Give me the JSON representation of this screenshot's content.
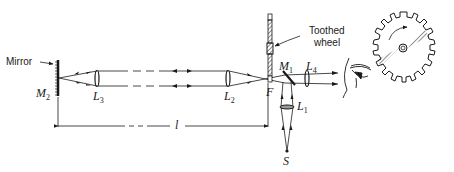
{
  "labels": {
    "mirror": "Mirror",
    "toothed_wheel_line1": "Toothed",
    "toothed_wheel_line2": "wheel",
    "M2": {
      "main": "M",
      "sub": "2"
    },
    "L3": {
      "main": "L",
      "sub": "3"
    },
    "L2": {
      "main": "L",
      "sub": "2"
    },
    "F": "F",
    "M1": {
      "main": "M",
      "sub": "1"
    },
    "L4": {
      "main": "L",
      "sub": "4"
    },
    "L1": {
      "main": "L",
      "sub": "1"
    },
    "S": "S",
    "distance": "l"
  },
  "components": [
    {
      "id": "M2",
      "type": "plane-mirror",
      "desc": "distant mirror"
    },
    {
      "id": "L3",
      "type": "lens"
    },
    {
      "id": "L2",
      "type": "lens"
    },
    {
      "id": "F",
      "type": "focal-point",
      "desc": "toothed wheel rim at focus"
    },
    {
      "id": "M1",
      "type": "half-silvered-mirror"
    },
    {
      "id": "L4",
      "type": "lens",
      "desc": "eyepiece"
    },
    {
      "id": "L1",
      "type": "lens",
      "desc": "condenser"
    },
    {
      "id": "S",
      "type": "light-source"
    },
    {
      "id": "eye",
      "type": "observer"
    },
    {
      "id": "wheel",
      "type": "toothed-wheel",
      "desc": "rotating wheel with teeth, inset"
    }
  ],
  "colors": {
    "ink": "#1a1a1a",
    "background": "#ffffff"
  }
}
